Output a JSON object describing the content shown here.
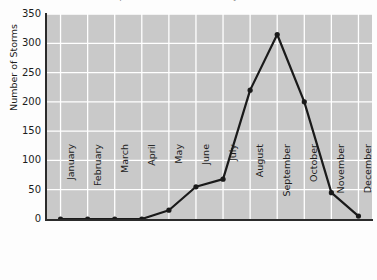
{
  "chart_data": {
    "type": "line",
    "title": "Tropical storm occurrence by month",
    "xlabel": "",
    "ylabel": "Number of Storms",
    "categories": [
      "January",
      "February",
      "March",
      "April",
      "May",
      "June",
      "July",
      "August",
      "September",
      "October",
      "November",
      "December"
    ],
    "values": [
      0,
      0,
      0,
      0,
      15,
      55,
      68,
      220,
      315,
      200,
      45,
      5
    ],
    "ylim": [
      0,
      350
    ],
    "yticks": [
      0,
      50,
      100,
      150,
      200,
      250,
      300,
      350
    ],
    "grid": true,
    "legend": false,
    "marker": "circle",
    "line_color": "#1a1a1a",
    "plot_background": "#c9c9c9",
    "grid_color": "#ffffff",
    "figure_background": "#fdfdfd"
  }
}
